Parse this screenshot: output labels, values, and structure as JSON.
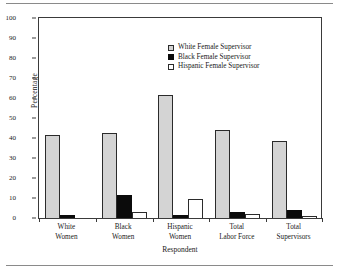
{
  "chart_data": {
    "type": "bar",
    "title": "",
    "xlabel": "Respondent",
    "ylabel": "Percentage",
    "ylim": [
      0,
      100
    ],
    "yticks": [
      0,
      10,
      20,
      30,
      40,
      50,
      60,
      70,
      80,
      90,
      100
    ],
    "grid": false,
    "legend_position": "upper right inside",
    "categories": [
      "White Women",
      "Black Women",
      "Hispanic Women",
      "Total Labor Force",
      "Total Supervisors"
    ],
    "category_lines": [
      [
        "White",
        "Women"
      ],
      [
        "Black",
        "Women"
      ],
      [
        "Hispanic",
        "Women"
      ],
      [
        "Total",
        "Labor Force"
      ],
      [
        "Total",
        "Supervisors"
      ]
    ],
    "series": [
      {
        "name": "White Female Supervisor",
        "color": "#d4d4d4",
        "values": [
          41.5,
          42.4,
          61.5,
          44.2,
          38.7
        ]
      },
      {
        "name": "Black Female Supervisor",
        "color": "#0b0b0b",
        "values": [
          1.4,
          11.4,
          1.7,
          3.2,
          4.0
        ]
      },
      {
        "name": "Hispanic Female Supervisor",
        "color": "#ffffff",
        "values": [
          0.0,
          2.9,
          9.6,
          2.2,
          1.2
        ]
      }
    ]
  },
  "figure": {
    "axis_color": "#3a3a3a",
    "rule_color": "#8a8a8a"
  }
}
